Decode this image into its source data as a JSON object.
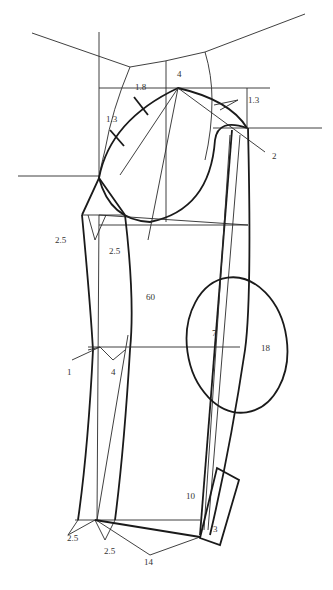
{
  "diagram": {
    "type": "garment sleeve pattern draft",
    "colors": {
      "line": "#1a1a1a",
      "background": "#ffffff",
      "label": "#333333"
    },
    "labels": {
      "cap_height": "4",
      "front_offset": "1.8",
      "front_curve": "1.3",
      "back_offset": "1.3",
      "back_extension": "2",
      "underarm_left": "2.5",
      "underarm_dart": "2.5",
      "sleeve_length": "60",
      "elbow_circle_offset": "7",
      "elbow_circle": "18",
      "elbow_left": "1",
      "elbow_dart": "4",
      "cuff_length": "10",
      "cuff_width": "3",
      "hem_left": "2.5",
      "hem_dart": "2.5",
      "hem_width": "14"
    }
  }
}
